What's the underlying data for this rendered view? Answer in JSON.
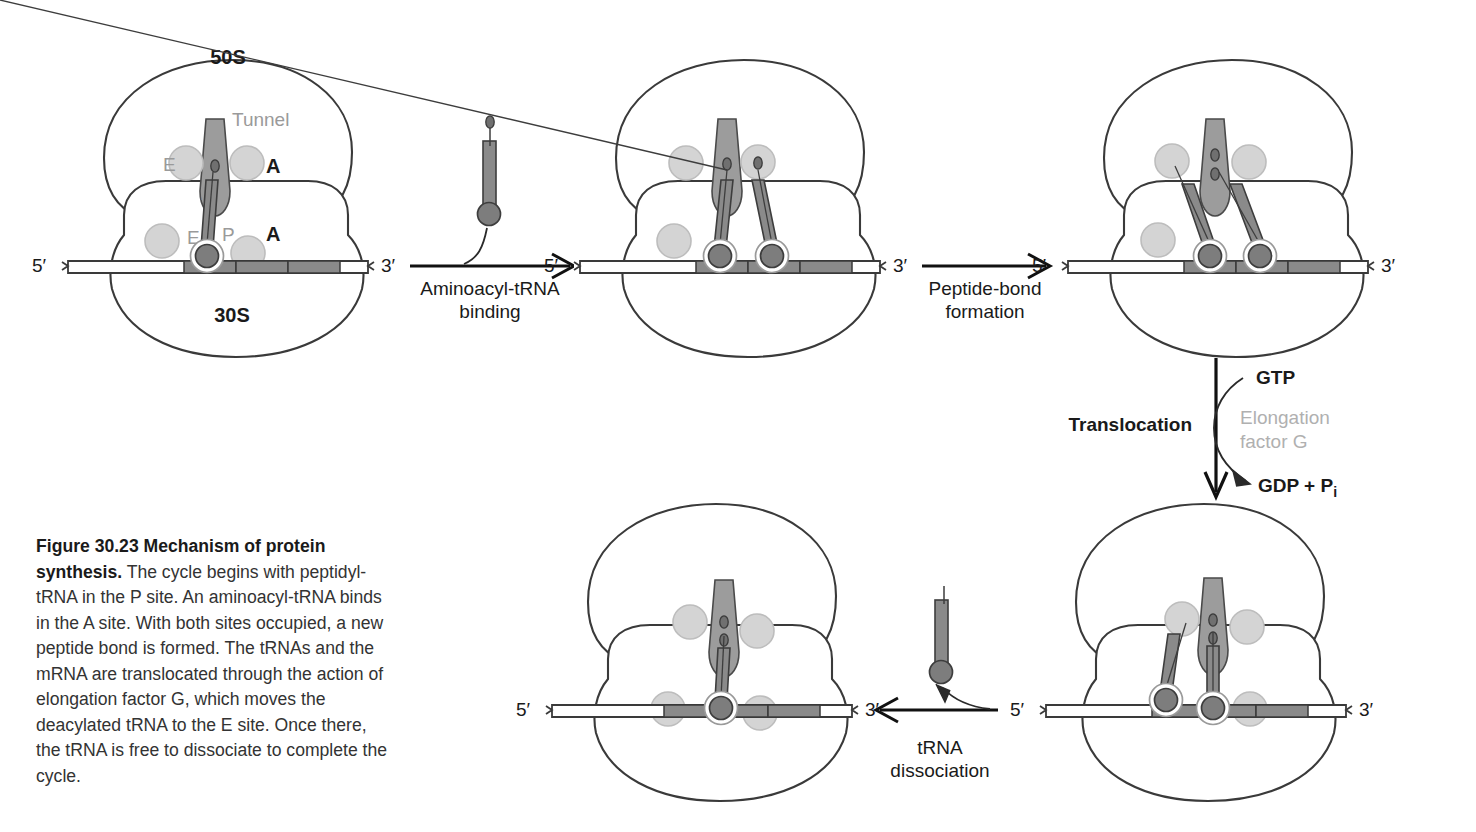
{
  "figure": {
    "number": "Figure 30.23",
    "title": "Mechanism of protein synthesis.",
    "caption": " The cycle begins with peptidyl-tRNA in the P site. An aminoacyl-tRNA binds in the A site. With both sites occupied, a new peptide bond is formed. The tRNAs and the mRNA are translocated through the action of elongation factor G, which moves the deacylated tRNA to the E site. Once there, the tRNA is free to dissociate to complete the cycle."
  },
  "colors": {
    "outline": "#3a3a3a",
    "tunnel_fill": "#9c9c9c",
    "trna_fill": "#8a8a8a",
    "site_circle_fill": "#d4d4d4",
    "site_circle_stroke": "#b4b4b4",
    "codon_fill": "#8a8a8a",
    "mrna_fill": "#ffffff",
    "gray_label": "#9a9a9a",
    "black_label": "#1a1a1a",
    "arrow": "#111111"
  },
  "labels": {
    "subunit_large": "50S",
    "subunit_small": "30S",
    "tunnel": "Tunnel",
    "site_e": "E",
    "site_p": "P",
    "site_a": "A",
    "five_prime": "5′",
    "three_prime": "3′"
  },
  "steps": {
    "aminoacyl_binding": [
      "Aminoacyl-tRNA",
      "binding"
    ],
    "peptide_bond": [
      "Peptide-bond",
      "formation"
    ],
    "translocation": "Translocation",
    "trna_dissociation": [
      "tRNA",
      "dissociation"
    ],
    "gtp": "GTP",
    "gdp_pi": "GDP + P",
    "gdp_pi_sub": "i",
    "elongation_factor": [
      "Elongation",
      "factor G"
    ]
  },
  "panels": [
    {
      "id": "panel-1-initiation",
      "name": "ribosome-initial-state",
      "position": "top-left",
      "labels_shown": [
        "50S",
        "30S",
        "Tunnel",
        "E",
        "A",
        "P",
        "E",
        "P",
        "A",
        "5′",
        "3′"
      ],
      "trna_count": 1,
      "trna_sites": [
        "P"
      ],
      "peptide_beads": 1,
      "free_trna": false
    },
    {
      "id": "panel-2-aminoacyl-bound",
      "name": "ribosome-aminoacyl-bound",
      "position": "top-middle",
      "labels_shown": [
        "5′",
        "3′"
      ],
      "trna_count": 2,
      "trna_sites": [
        "P",
        "A"
      ],
      "peptide_beads": 1,
      "free_trna": false
    },
    {
      "id": "panel-3-peptide-bond-formed",
      "name": "ribosome-peptide-bond-formed",
      "position": "top-right",
      "labels_shown": [
        "5′",
        "3′"
      ],
      "trna_count": 2,
      "trna_sites": [
        "P",
        "A"
      ],
      "peptide_beads": 2,
      "free_trna": false
    },
    {
      "id": "panel-4-translocated",
      "name": "ribosome-translocated",
      "position": "bottom-right",
      "labels_shown": [
        "5′",
        "3′"
      ],
      "trna_count": 2,
      "trna_sites": [
        "E",
        "P"
      ],
      "peptide_beads": 2,
      "free_trna": false
    },
    {
      "id": "panel-5-trna-released",
      "name": "ribosome-trna-released",
      "position": "bottom-left",
      "labels_shown": [
        "5′",
        "3′"
      ],
      "trna_count": 1,
      "trna_sites": [
        "P"
      ],
      "peptide_beads": 2,
      "free_trna": false
    }
  ],
  "free_trnas": [
    {
      "id": "incoming-aminoacyl-trna",
      "charged": true,
      "position": "above-aminoacyl-binding-arrow"
    },
    {
      "id": "released-deacylated-trna",
      "charged": false,
      "position": "above-trna-dissociation-arrow"
    }
  ]
}
